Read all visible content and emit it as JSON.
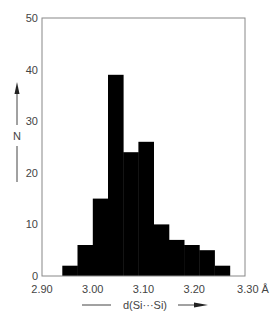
{
  "chart_data": {
    "type": "bar",
    "subtype": "histogram",
    "title": "",
    "xlabel": "d(Si···Si)",
    "xunit": "Å",
    "ylabel": "N",
    "xlim": [
      2.9,
      3.3
    ],
    "ylim": [
      0,
      50
    ],
    "grid": false,
    "legend": null,
    "x_ticks": [
      "2.90",
      "3.00",
      "3.10",
      "3.20",
      "3.30"
    ],
    "y_ticks": [
      "0",
      "10",
      "20",
      "30",
      "40",
      "50"
    ],
    "bin_width": 0.03,
    "bin_edges": [
      2.94,
      2.97,
      3.0,
      3.03,
      3.06,
      3.09,
      3.12,
      3.15,
      3.18,
      3.21,
      3.24,
      3.27
    ],
    "categories": [
      "2.94-2.97",
      "2.97-3.00",
      "3.00-3.03",
      "3.03-3.06",
      "3.06-3.09",
      "3.09-3.12",
      "3.12-3.15",
      "3.15-3.18",
      "3.18-3.21",
      "3.21-3.24",
      "3.24-3.27"
    ],
    "values": [
      2,
      6,
      15,
      39,
      24,
      26,
      10,
      7,
      6,
      5,
      2
    ],
    "bar_color": "#000000",
    "frame_color": "#888888"
  },
  "labels": {
    "xlabel": "d(Si···Si)",
    "xunit": "Å",
    "ylabel": "N"
  }
}
